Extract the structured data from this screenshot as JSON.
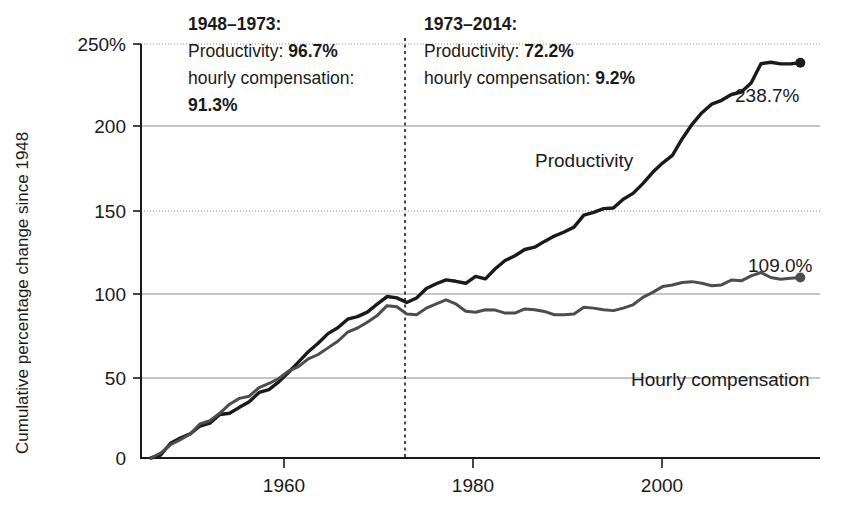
{
  "chart_data": {
    "type": "line",
    "title": "",
    "xlabel": "",
    "ylabel": "Cumulative percentage change since 1948",
    "xlim": [
      1947,
      2016
    ],
    "ylim": [
      0,
      250
    ],
    "grid": true,
    "legend_position": "inline-labels",
    "y_ticks": [
      "250%",
      "200",
      "150",
      "100",
      "50",
      "0"
    ],
    "y_tick_values": [
      250,
      200,
      150,
      100,
      50,
      0
    ],
    "x_ticks": [
      "1960",
      "1980",
      "2000"
    ],
    "x_tick_values": [
      1960,
      1980,
      2000
    ],
    "divider_year": 1973,
    "series": [
      {
        "name": "Productivity",
        "color": "#1a1a1a",
        "end_value_label": "238.7%",
        "end_value": 238.7,
        "x": [
          1948,
          1949,
          1950,
          1951,
          1952,
          1953,
          1954,
          1955,
          1956,
          1957,
          1958,
          1959,
          1960,
          1961,
          1962,
          1963,
          1964,
          1965,
          1966,
          1967,
          1968,
          1969,
          1970,
          1971,
          1972,
          1973,
          1974,
          1975,
          1976,
          1977,
          1978,
          1979,
          1980,
          1981,
          1982,
          1983,
          1984,
          1985,
          1986,
          1987,
          1988,
          1989,
          1990,
          1991,
          1992,
          1993,
          1994,
          1995,
          1996,
          1997,
          1998,
          1999,
          2000,
          2001,
          2002,
          2003,
          2004,
          2005,
          2006,
          2007,
          2008,
          2009,
          2010,
          2011,
          2012,
          2013,
          2014
        ],
        "values": [
          0,
          1.8,
          8.9,
          12.1,
          14.6,
          19.3,
          21.0,
          26.3,
          27.0,
          30.6,
          34.0,
          39.6,
          41.3,
          46.0,
          51.8,
          57.9,
          64.2,
          69.3,
          75.1,
          78.6,
          83.8,
          85.4,
          88.1,
          92.9,
          97.5,
          96.7,
          93.9,
          96.6,
          102.4,
          105.2,
          107.6,
          106.7,
          105.5,
          109.7,
          108.2,
          114.3,
          119.3,
          122.1,
          125.9,
          127.3,
          130.8,
          134.0,
          136.5,
          139.4,
          146.7,
          148.3,
          150.6,
          151.0,
          156.3,
          159.8,
          165.7,
          172.5,
          178.1,
          182.7,
          192.8,
          201.5,
          208.5,
          213.7,
          216.0,
          219.5,
          221.0,
          226.5,
          238.1,
          239.0,
          238.0,
          238.0,
          238.7
        ]
      },
      {
        "name": "Hourly compensation",
        "color": "#4d4d4d",
        "end_value_label": "109.0%",
        "end_value": 109.0,
        "x": [
          1948,
          1949,
          1950,
          1951,
          1952,
          1953,
          1954,
          1955,
          1956,
          1957,
          1958,
          1959,
          1960,
          1961,
          1962,
          1963,
          1964,
          1965,
          1966,
          1967,
          1968,
          1969,
          1970,
          1971,
          1972,
          1973,
          1974,
          1975,
          1976,
          1977,
          1978,
          1979,
          1980,
          1981,
          1982,
          1983,
          1984,
          1985,
          1986,
          1987,
          1988,
          1989,
          1990,
          1991,
          1992,
          1993,
          1994,
          1995,
          1996,
          1997,
          1998,
          1999,
          2000,
          2001,
          2002,
          2003,
          2004,
          2005,
          2006,
          2007,
          2008,
          2009,
          2010,
          2011,
          2012,
          2013,
          2014
        ],
        "values": [
          0,
          3.0,
          8.0,
          11.0,
          14.5,
          20.6,
          22.5,
          27.0,
          32.5,
          36.0,
          37.3,
          42.5,
          45.0,
          48.0,
          52.5,
          55.2,
          59.9,
          62.5,
          66.5,
          70.5,
          76.0,
          78.5,
          82.0,
          86.0,
          92.0,
          91.3,
          87.0,
          86.5,
          90.5,
          93.0,
          95.5,
          93.0,
          88.6,
          88.0,
          89.5,
          89.3,
          87.5,
          87.5,
          90.0,
          89.5,
          88.5,
          86.5,
          86.5,
          87.0,
          91.0,
          90.5,
          89.5,
          89.0,
          90.5,
          92.5,
          97.0,
          100.0,
          103.5,
          104.5,
          106.0,
          106.5,
          105.5,
          104.0,
          104.5,
          107.5,
          107.0,
          110.0,
          112.0,
          109.0,
          108.0,
          108.5,
          109.0
        ]
      }
    ],
    "annotations": [
      {
        "id": "annotation-1948-1973",
        "lines": [
          [
            {
              "text": "1948–1973:",
              "bold": true
            }
          ],
          [
            {
              "text": "Productivity: ",
              "bold": false
            },
            {
              "text": "96.7%",
              "bold": true
            }
          ],
          [
            {
              "text": "hourly compensation:",
              "bold": false
            }
          ],
          [
            {
              "text": "91.3%",
              "bold": true
            }
          ]
        ]
      },
      {
        "id": "annotation-1973-2014",
        "lines": [
          [
            {
              "text": "1973–2014:",
              "bold": true
            }
          ],
          [
            {
              "text": "Productivity: ",
              "bold": false
            },
            {
              "text": "72.2%",
              "bold": true
            }
          ],
          [
            {
              "text": "hourly compensation: ",
              "bold": false
            },
            {
              "text": "9.2%",
              "bold": true
            }
          ]
        ]
      }
    ]
  },
  "labels": {
    "y_axis_title": "Cumulative percentage change since 1948",
    "productivity_label": "Productivity",
    "compensation_label": "Hourly compensation",
    "productivity_end": "238.7%",
    "compensation_end": "109.0%",
    "y_tick_250": "250%",
    "y_tick_200": "200",
    "y_tick_150": "150",
    "y_tick_100": "100",
    "y_tick_50": "50",
    "y_tick_0": "0",
    "x_tick_1960": "1960",
    "x_tick_1980": "1980",
    "x_tick_2000": "2000"
  },
  "colors": {
    "productivity": "#1a1a1a",
    "compensation": "#4d4d4d",
    "grid": "#8c8c8c",
    "axis": "#1a1a1a",
    "background": "#ffffff"
  }
}
